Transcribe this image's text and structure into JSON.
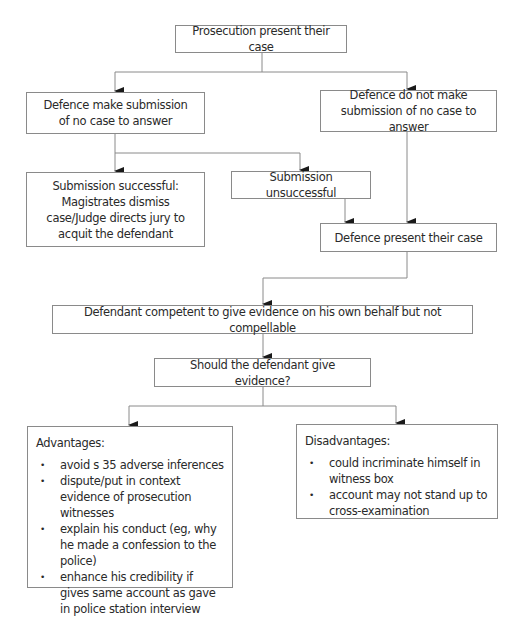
{
  "diagram": {
    "type": "flowchart",
    "nodes": {
      "prosecution": "Prosecution present their case",
      "submission_made": "Defence make submission of no case to answer",
      "submission_not_made": "Defence do not make submission of no case to answer",
      "submission_successful": "Submission successful: Magistrates dismiss case/Judge directs jury to acquit the defendant",
      "submission_unsuccessful": "Submission unsuccessful",
      "defence_case": "Defence present their case",
      "competent": "Defendant competent to give evidence on his own behalf but not compellable",
      "question": "Should the defendant give evidence?",
      "advantages": {
        "heading": "Advantages:",
        "items": [
          "avoid s 35 adverse inferences",
          "dispute/put in context evidence of prosecution witnesses",
          "explain his conduct (eg, why he made a confession to the police)",
          "enhance his credibility if gives same account as gave in police station interview"
        ]
      },
      "disadvantages": {
        "heading": "Disadvantages:",
        "items": [
          "could incriminate himself in witness box",
          "account may not stand up to cross-examination"
        ]
      }
    },
    "edges": [
      [
        "prosecution",
        "submission_made"
      ],
      [
        "prosecution",
        "submission_not_made"
      ],
      [
        "submission_made",
        "submission_successful"
      ],
      [
        "submission_made",
        "submission_unsuccessful"
      ],
      [
        "submission_unsuccessful",
        "defence_case"
      ],
      [
        "submission_not_made",
        "defence_case"
      ],
      [
        "defence_case",
        "competent"
      ],
      [
        "competent",
        "question"
      ],
      [
        "question",
        "advantages"
      ],
      [
        "question",
        "disadvantages"
      ]
    ],
    "colors": {
      "line": "#8a8a8a",
      "arrow": "#1a1a1a",
      "text": "#2a2a2a"
    }
  }
}
